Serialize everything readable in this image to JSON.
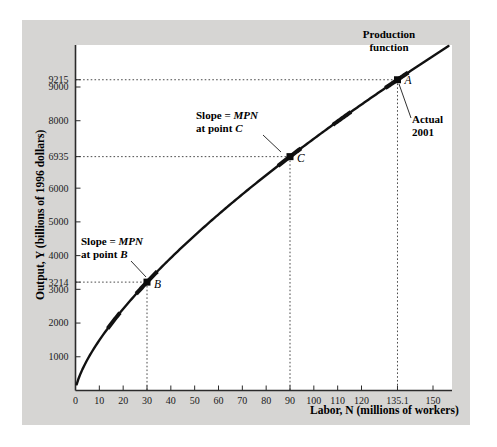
{
  "chart_data": {
    "type": "line",
    "title": "",
    "xlabel": "Labor, N (millions of workers)",
    "ylabel": "Output, Y (billions of 1996 dollars)",
    "xlim": [
      0,
      160
    ],
    "ylim": [
      0,
      9800
    ],
    "grid": false,
    "legend": "none",
    "curve_name": "Production function",
    "x_ticks": [
      "0",
      "10",
      "20",
      "30",
      "40",
      "50",
      "60",
      "70",
      "80",
      "90",
      "100",
      "110",
      "120",
      "135.1",
      "150"
    ],
    "x_tick_values": [
      0,
      10,
      20,
      30,
      40,
      50,
      60,
      70,
      80,
      90,
      100,
      110,
      120,
      135.1,
      150
    ],
    "y_ticks": [
      "1000",
      "2000",
      "3000",
      "3214",
      "4000",
      "5000",
      "6000",
      "6935",
      "8000",
      "9000",
      "9215"
    ],
    "y_tick_values": [
      1000,
      2000,
      3000,
      3214,
      4000,
      5000,
      6000,
      6935,
      8000,
      9000,
      9215
    ],
    "series": [
      {
        "name": "Production function",
        "x": [
          2,
          4,
          6,
          8,
          10,
          12.5,
          15,
          17.5,
          20,
          25,
          30,
          35,
          40,
          45,
          50,
          60,
          70,
          80,
          90,
          100,
          110,
          120,
          130,
          135.1,
          140,
          150,
          155
        ],
        "values": [
          760,
          1130,
          1420,
          1660,
          1870,
          2100,
          2310,
          2500,
          2680,
          3000,
          3214,
          3560,
          3820,
          4070,
          4300,
          4740,
          5150,
          5530,
          6935,
          7400,
          7860,
          8300,
          8730,
          9215,
          9170,
          9560,
          9760
        ]
      }
    ],
    "points": [
      {
        "label": "A",
        "x": 135.1,
        "y": 9215,
        "note": "Actual 2001"
      },
      {
        "label": "C",
        "x": 90,
        "y": 6935,
        "note": "Slope = MPN at point C"
      },
      {
        "label": "B",
        "x": 30,
        "y": 3214,
        "note": "Slope = MPN at point B"
      }
    ],
    "annotations": [
      {
        "name": "production-function",
        "line1": "Production",
        "line2": "function"
      },
      {
        "name": "slope-c",
        "line1_pre": "Slope = ",
        "line1_it": "MPN",
        "line2_pre": "at point ",
        "line2_it": "C"
      },
      {
        "name": "slope-b",
        "line1_pre": "Slope = ",
        "line1_it": "MPN",
        "line2_pre": "at point ",
        "line2_it": "B"
      },
      {
        "name": "actual-2001",
        "line1": "Actual",
        "line2": "2001"
      }
    ],
    "colors": {
      "curve": "#111111",
      "panel_background": "#d6d5d3",
      "plot_background": "#ffffff",
      "axis": "#3a3a3a",
      "guide_line": "#555555",
      "text": "#000000"
    }
  }
}
